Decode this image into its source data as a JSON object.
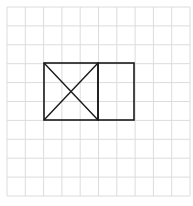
{
  "diagram": {
    "grid": {
      "cols": 10,
      "rows": 10,
      "x0": 7,
      "y0": 7,
      "x1": 190,
      "y1": 196,
      "color": "#dcdcdc"
    },
    "figure": {
      "stroke": "#1a1a1a",
      "square": {
        "x": 44,
        "y": 63,
        "w": 54,
        "h": 57
      },
      "rectangle": {
        "x": 98,
        "y": 63,
        "w": 36,
        "h": 57
      },
      "diagonals": [
        [
          44,
          63,
          98,
          120
        ],
        [
          98,
          63,
          44,
          120
        ]
      ]
    }
  }
}
